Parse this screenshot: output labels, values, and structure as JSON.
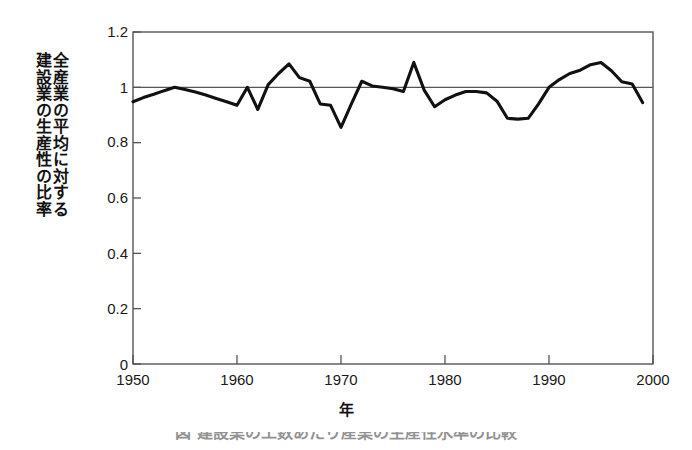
{
  "figure": {
    "caption_partial": "図  建設業の工数あたり産業の生産性水準の比較",
    "background_color": "#ffffff",
    "line_color": "#111111",
    "axis_color": "#555555"
  },
  "axes": {
    "ylabel_column_right": "全産業の平均に対する",
    "ylabel_column_left": "建設業の生産性の比率",
    "xlabel": "年",
    "yticks": [
      "0",
      "0.2",
      "0.4",
      "0.6",
      "0.8",
      "1",
      "1.2"
    ],
    "xticks": [
      "1950",
      "1960",
      "1970",
      "1980",
      "1990",
      "2000"
    ]
  },
  "chart_data": {
    "type": "line",
    "title": "",
    "subtitle": "",
    "xlabel": "年",
    "ylabel": "全産業の平均に対する建設業の生産性の比率",
    "xlim": [
      1950,
      2000
    ],
    "ylim": [
      0,
      1.2
    ],
    "ytick_values": [
      0,
      0.2,
      0.4,
      0.6,
      0.8,
      1.0,
      1.2
    ],
    "xtick_values": [
      1950,
      1960,
      1970,
      1980,
      1990,
      2000
    ],
    "grid": false,
    "legend": "none",
    "annotations": [
      {
        "type": "hline",
        "y": 1.0,
        "label": "reference line at ratio = 1.0"
      }
    ],
    "series": [
      {
        "name": "建設業の生産性の比率",
        "color": "#111111",
        "x": [
          1950,
          1951,
          1952,
          1953,
          1954,
          1955,
          1956,
          1957,
          1958,
          1959,
          1960,
          1961,
          1962,
          1963,
          1964,
          1965,
          1966,
          1967,
          1968,
          1969,
          1970,
          1971,
          1972,
          1973,
          1974,
          1975,
          1976,
          1977,
          1978,
          1979,
          1980,
          1981,
          1982,
          1983,
          1984,
          1985,
          1986,
          1987,
          1988,
          1989,
          1990,
          1991,
          1992,
          1993,
          1994,
          1995,
          1996,
          1997,
          1998,
          1999
        ],
        "values": [
          0.948,
          0.963,
          0.975,
          0.988,
          1.0,
          0.992,
          0.983,
          0.972,
          0.96,
          0.948,
          0.935,
          1.0,
          0.92,
          1.01,
          1.05,
          1.085,
          1.035,
          1.022,
          0.94,
          0.935,
          0.855,
          0.94,
          1.022,
          1.005,
          1.0,
          0.995,
          0.985,
          1.09,
          0.99,
          0.93,
          0.955,
          0.972,
          0.985,
          0.985,
          0.98,
          0.95,
          0.888,
          0.885,
          0.888,
          0.94,
          1.0,
          1.028,
          1.05,
          1.062,
          1.082,
          1.09,
          1.06,
          1.02,
          1.012,
          0.945
        ]
      }
    ]
  }
}
